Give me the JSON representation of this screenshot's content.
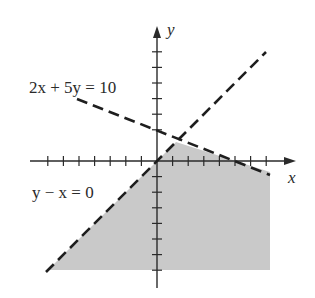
{
  "diagram": {
    "type": "linear-inequality-graph",
    "colors": {
      "background": "#ffffff",
      "shade": "#c9c9c9",
      "axis": "#2a2a2a",
      "line": "#1e1e1e"
    },
    "axes": {
      "x_label": "x",
      "y_label": "y",
      "x_ticks_negative": 7,
      "x_ticks_positive": 7,
      "y_ticks_positive": 6,
      "y_ticks_negative": 7
    },
    "lines": [
      {
        "id": "line-1",
        "label": "2x + 5y = 10",
        "style": "dashed"
      },
      {
        "id": "line-2",
        "label": "y − x = 0",
        "style": "dashed"
      }
    ],
    "shaded_region": "Below both 2x + 5y = 10 and y − x = 0"
  }
}
